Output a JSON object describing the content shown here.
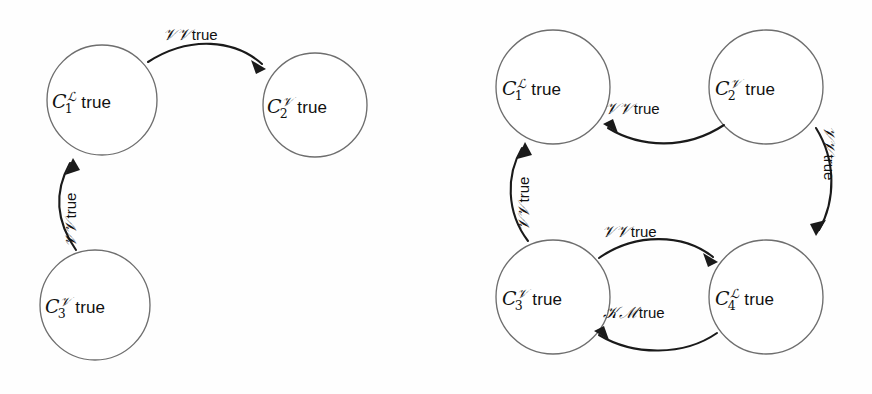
{
  "figure": {
    "background_color": "#fefefe",
    "node_stroke_color": "#6e6e6e",
    "edge_color": "#1a1a1a",
    "text_color": "#111111",
    "panels": [
      "left",
      "right"
    ]
  },
  "symbols": {
    "script_L": "ℒ",
    "script_V": "𝒱",
    "script_K": "𝒦",
    "script_M": "ℳ",
    "true_word": "true",
    "C": "C"
  },
  "left_panel": {
    "name": "three-node-diagram",
    "nodes": [
      {
        "id": "n1",
        "base": "C",
        "sub": "1",
        "sup": "ℒ",
        "word": "true",
        "cx": 102,
        "cy": 100,
        "r": 55
      },
      {
        "id": "n2",
        "base": "C",
        "sub": "2",
        "sup": "𝒱",
        "word": "true",
        "cx": 315,
        "cy": 105,
        "r": 52
      },
      {
        "id": "n3",
        "base": "C",
        "sub": "3",
        "sup": "𝒱",
        "word": "true",
        "cx": 95,
        "cy": 305,
        "r": 55
      }
    ],
    "edges": [
      {
        "id": "e1",
        "from": "n1",
        "to": "n2",
        "sym1": "𝒱",
        "sym2": "𝒱",
        "word": "true",
        "label": "𝒱𝒱 true",
        "orientation": "horizontal",
        "direction": "right"
      },
      {
        "id": "e2",
        "from": "n3",
        "to": "n1",
        "sym1": "𝒱",
        "sym2": "𝒱",
        "word": "true",
        "label": "𝒱𝒱 true",
        "orientation": "vertical",
        "direction": "up"
      }
    ]
  },
  "right_panel": {
    "name": "four-node-diagram",
    "nodes": [
      {
        "id": "m1",
        "base": "C",
        "sub": "1",
        "sup": "ℒ",
        "word": "true",
        "cx": 117,
        "cy": 87,
        "r": 57
      },
      {
        "id": "m2",
        "base": "C",
        "sub": "2",
        "sup": "𝒱",
        "word": "true",
        "cx": 330,
        "cy": 87,
        "r": 57
      },
      {
        "id": "m3",
        "base": "C",
        "sub": "3",
        "sup": "𝒱",
        "word": "true",
        "cx": 117,
        "cy": 297,
        "r": 57
      },
      {
        "id": "m4",
        "base": "C",
        "sub": "4",
        "sup": "ℒ",
        "word": "true",
        "cx": 330,
        "cy": 297,
        "r": 57
      }
    ],
    "edges": [
      {
        "id": "f1",
        "from": "m2",
        "to": "m1",
        "sym1": "𝒱",
        "sym2": "𝒱",
        "word": "true",
        "label": "𝒱𝒱 true",
        "orientation": "horizontal",
        "direction": "left"
      },
      {
        "id": "f2",
        "from": "m2",
        "to": "m4",
        "sym1": "𝒱",
        "sym2": "𝒱",
        "word": "true",
        "label": "𝒱𝒱 true",
        "orientation": "vertical",
        "direction": "down"
      },
      {
        "id": "f3",
        "from": "m3",
        "to": "m4",
        "sym1": "𝒱",
        "sym2": "𝒱",
        "word": "true",
        "label": "𝒱𝒱 true",
        "orientation": "horizontal",
        "direction": "right"
      },
      {
        "id": "f4",
        "from": "m4",
        "to": "m3",
        "sym1": "𝒦",
        "sym2": "ℳ",
        "word": "true",
        "label": "𝒦ℳ true",
        "orientation": "horizontal",
        "direction": "left"
      },
      {
        "id": "f5",
        "from": "m3",
        "to": "m1",
        "sym1": "𝒱",
        "sym2": "𝒱",
        "word": "true",
        "label": "𝒱𝒱 true",
        "orientation": "vertical",
        "direction": "up"
      }
    ]
  }
}
